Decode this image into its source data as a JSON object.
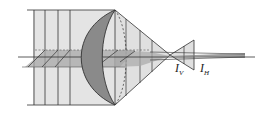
{
  "diagram": {
    "type": "astigmatism-optics",
    "labels": {
      "vertical_focal_line": {
        "main": "I",
        "sub": "V"
      },
      "horizontal_focal_line": {
        "main": "I",
        "sub": "H"
      }
    },
    "colors": {
      "beam_fill": "#e4e4e4",
      "lens_fill": "#8a8a8a",
      "plane_fill": "#a8a8a8",
      "line": "#333333"
    }
  }
}
